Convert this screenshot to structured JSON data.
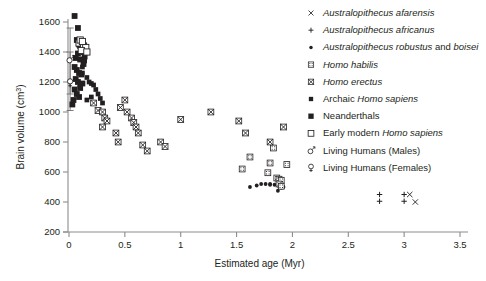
{
  "chart_data": {
    "type": "scatter",
    "title": "",
    "xlabel": "Estimated age (Myr)",
    "ylabel": "Brain volume (cm3)",
    "ylabel_display": "Brain volume (cm",
    "ylabel_sup": "3",
    "ylabel_tail": ")",
    "xlim": [
      0,
      3.5
    ],
    "ylim": [
      200,
      1600
    ],
    "xticks": [
      "0",
      "0.5",
      "1",
      "1.5",
      "2",
      "2.5",
      "3",
      "3.5"
    ],
    "xtick_values": [
      0,
      0.5,
      1,
      1.5,
      2,
      2.5,
      3,
      3.5
    ],
    "yticks": [
      "200",
      "400",
      "600",
      "800",
      "1000",
      "1200",
      "1400",
      "1600"
    ],
    "ytick_values": [
      200,
      400,
      600,
      800,
      1000,
      1200,
      1400,
      1600
    ],
    "grid": false,
    "legend_position": "top-right",
    "legend": [
      {
        "label": "Australopithecus afarensis",
        "marker": "x-cross",
        "italic": "all"
      },
      {
        "label": "Australopithecus africanus",
        "marker": "plus",
        "italic": "all"
      },
      {
        "label": "Australopithecus robustus and boisei",
        "marker": "dot",
        "italic": "partial"
      },
      {
        "label": "Homo habilis",
        "marker": "dotted-square",
        "italic": "all"
      },
      {
        "label": "Homo erectus",
        "marker": "crossed-square",
        "italic": "all"
      },
      {
        "label": "Archaic Homo sapiens",
        "marker": "small-filled-square",
        "italic": "partial"
      },
      {
        "label": "Neanderthals",
        "marker": "filled-square",
        "italic": "none"
      },
      {
        "label": "Early modern Homo sapiens",
        "marker": "open-square",
        "italic": "partial"
      },
      {
        "label": "Living Humans (Males)",
        "marker": "mars",
        "italic": "none"
      },
      {
        "label": "Living Humans (Females)",
        "marker": "venus",
        "italic": "none"
      }
    ],
    "series": [
      {
        "name": "Australopithecus afarensis",
        "marker": "x-cross",
        "points": [
          [
            3.05,
            450
          ],
          [
            3.1,
            400
          ]
        ]
      },
      {
        "name": "Australopithecus africanus",
        "marker": "plus",
        "points": [
          [
            2.78,
            450
          ],
          [
            2.78,
            405
          ],
          [
            3.0,
            450
          ],
          [
            3.0,
            405
          ]
        ]
      },
      {
        "name": "Australopithecus robustus and boisei",
        "marker": "dot",
        "points": [
          [
            1.62,
            500
          ],
          [
            1.68,
            510
          ],
          [
            1.72,
            520
          ],
          [
            1.76,
            520
          ],
          [
            1.8,
            520
          ],
          [
            1.84,
            515
          ],
          [
            1.88,
            505
          ],
          [
            1.9,
            495
          ],
          [
            1.87,
            475
          ],
          [
            1.92,
            500
          ],
          [
            1.8,
            515
          ]
        ]
      },
      {
        "name": "Homo habilis",
        "marker": "dotted-square",
        "points": [
          [
            1.55,
            620
          ],
          [
            1.62,
            700
          ],
          [
            1.78,
            595
          ],
          [
            1.8,
            660
          ],
          [
            1.86,
            560
          ],
          [
            1.88,
            552
          ],
          [
            1.9,
            545
          ],
          [
            1.88,
            520
          ],
          [
            1.9,
            505
          ],
          [
            1.95,
            650
          ],
          [
            1.83,
            760
          ]
        ]
      },
      {
        "name": "Homo erectus",
        "marker": "crossed-square",
        "points": [
          [
            0.22,
            1060
          ],
          [
            0.26,
            1010
          ],
          [
            0.3,
            1000
          ],
          [
            0.32,
            960
          ],
          [
            0.34,
            940
          ],
          [
            0.3,
            900
          ],
          [
            0.42,
            860
          ],
          [
            0.44,
            800
          ],
          [
            0.52,
            1000
          ],
          [
            0.56,
            960
          ],
          [
            0.58,
            930
          ],
          [
            0.6,
            900
          ],
          [
            0.62,
            860
          ],
          [
            0.66,
            780
          ],
          [
            0.7,
            740
          ],
          [
            0.82,
            800
          ],
          [
            0.86,
            770
          ],
          [
            1.0,
            950
          ],
          [
            1.27,
            1000
          ],
          [
            1.52,
            940
          ],
          [
            1.58,
            860
          ],
          [
            1.8,
            800
          ],
          [
            1.92,
            900
          ],
          [
            0.46,
            1030
          ],
          [
            0.5,
            1080
          ]
        ]
      },
      {
        "name": "Archaic Homo sapiens",
        "marker": "small-filled-square",
        "points": [
          [
            0.12,
            1260
          ],
          [
            0.16,
            1230
          ],
          [
            0.18,
            1200
          ],
          [
            0.2,
            1190
          ],
          [
            0.22,
            1180
          ],
          [
            0.24,
            1150
          ],
          [
            0.26,
            1120
          ],
          [
            0.2,
            1100
          ],
          [
            0.16,
            1080
          ],
          [
            0.28,
            1090
          ],
          [
            0.3,
            1060
          ],
          [
            0.12,
            1300
          ],
          [
            0.14,
            1340
          ],
          [
            0.1,
            1180
          ]
        ]
      },
      {
        "name": "Neanderthals",
        "marker": "filled-square",
        "points": [
          [
            0.05,
            1640
          ],
          [
            0.08,
            1560
          ],
          [
            0.07,
            1480
          ],
          [
            0.09,
            1450
          ],
          [
            0.1,
            1440
          ],
          [
            0.11,
            1420
          ],
          [
            0.12,
            1430
          ],
          [
            0.13,
            1400
          ],
          [
            0.08,
            1390
          ],
          [
            0.06,
            1360
          ],
          [
            0.1,
            1350
          ],
          [
            0.05,
            1300
          ],
          [
            0.07,
            1280
          ],
          [
            0.09,
            1260
          ],
          [
            0.11,
            1250
          ],
          [
            0.06,
            1220
          ],
          [
            0.08,
            1200
          ],
          [
            0.12,
            1190
          ],
          [
            0.1,
            1160
          ],
          [
            0.05,
            1150
          ],
          [
            0.07,
            1120
          ],
          [
            0.09,
            1100
          ],
          [
            0.04,
            1080
          ],
          [
            0.03,
            1050
          ],
          [
            0.14,
            1370
          ],
          [
            0.13,
            1320
          ]
        ]
      },
      {
        "name": "Early modern Homo sapiens",
        "marker": "open-square",
        "points": [
          [
            0.09,
            1460
          ],
          [
            0.13,
            1440
          ],
          [
            0.15,
            1430
          ],
          [
            0.11,
            1410
          ],
          [
            0.1,
            1480
          ],
          [
            0.16,
            1400
          ],
          [
            0.12,
            1470
          ]
        ]
      },
      {
        "name": "Living Humans (Males)",
        "marker": "mars",
        "points": [
          [
            0.01,
            1350
          ]
        ],
        "error_bars": [
          {
            "x": 0.01,
            "y": 1350,
            "low": 1120,
            "high": 1560
          }
        ]
      },
      {
        "name": "Living Humans (Females)",
        "marker": "venus",
        "points": [
          [
            0.01,
            1195
          ]
        ],
        "error_bars": [
          {
            "x": 0.01,
            "y": 1195,
            "low": 1010,
            "high": 1400
          }
        ]
      }
    ]
  }
}
